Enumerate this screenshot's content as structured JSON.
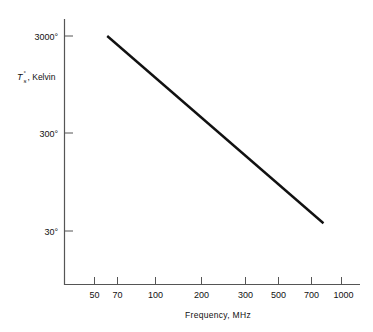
{
  "chart_data": {
    "type": "line",
    "title": "",
    "xlabel": "Frequency, MHz",
    "ylabel": "T°s , Kelvin",
    "ylabel_parts": {
      "symbol": "T",
      "subscript": "s",
      "superscript": "°",
      "rest": ", Kelvin"
    },
    "xscale": "log",
    "yscale": "log",
    "xlim": [
      38,
      1300
    ],
    "ylim": [
      9,
      6000
    ],
    "grid": false,
    "legend": null,
    "xticks": [
      {
        "value": 50,
        "label": "50"
      },
      {
        "value": 70,
        "label": "70"
      },
      {
        "value": 100,
        "label": "100"
      },
      {
        "value": 200,
        "label": "200"
      },
      {
        "value": 300,
        "label": "300"
      },
      {
        "value": 500,
        "label": "500"
      },
      {
        "value": 700,
        "label": "700"
      },
      {
        "value": 1000,
        "label": "1000"
      }
    ],
    "yticks": [
      {
        "value": 3000,
        "label": "3000°"
      },
      {
        "value": 300,
        "label": "300°"
      },
      {
        "value": 30,
        "label": "30°"
      }
    ],
    "series": [
      {
        "name": "sky-noise-temperature",
        "color": "#111111",
        "x": [
          55,
          70,
          100,
          200,
          300,
          500,
          700,
          800
        ],
        "y": [
          3000,
          1880,
          1010,
          320,
          163,
          73,
          43,
          36
        ],
        "points": [
          {
            "x": 55,
            "y": 3000
          },
          {
            "x": 800,
            "y": 36
          }
        ]
      }
    ],
    "annotations": []
  },
  "axis_colors": {
    "axis_line": "#555555",
    "tick": "#555555",
    "curve": "#111111"
  }
}
